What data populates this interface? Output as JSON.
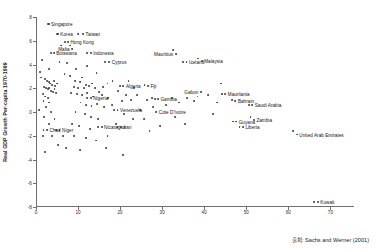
{
  "chart_data": {
    "type": "scatter",
    "title": "",
    "xlabel": "",
    "ylabel": "Real GDP Growth Per-capita 1970-1999",
    "xlim": [
      0,
      75.6
    ],
    "ylim": [
      -8,
      8
    ],
    "xticks": [
      0,
      10,
      20,
      30,
      40,
      50,
      60,
      70
    ],
    "xtick_labels": [
      "0",
      "10",
      "20",
      "30",
      "40",
      "50",
      "60",
      "70"
    ],
    "yticks": [
      8,
      6,
      4,
      2,
      0,
      -2,
      -4,
      -6,
      -8
    ],
    "ytick_labels": [
      "8",
      "6",
      "4",
      "2",
      "0",
      "-2",
      "-4",
      "-6",
      "-8"
    ],
    "grid": false,
    "legend": null,
    "marker_color": "#3a3a3a",
    "axis_color": "#6f6f6f",
    "labeled_points": [
      {
        "name": "Singapore",
        "x": 3.0,
        "y": 7.4,
        "side": "right"
      },
      {
        "name": "Korea",
        "x": 5.2,
        "y": 6.6,
        "side": "right"
      },
      {
        "name": "Taiwan",
        "x": 11.2,
        "y": 6.6,
        "side": "right"
      },
      {
        "name": "Hong Kong",
        "x": 7.6,
        "y": 5.9,
        "side": "right"
      },
      {
        "name": "Malta",
        "x": 8.6,
        "y": 5.3,
        "side": "left"
      },
      {
        "name": "Botswana",
        "x": 4.2,
        "y": 5.0,
        "side": "right"
      },
      {
        "name": "Indonesia",
        "x": 13.0,
        "y": 5.0,
        "side": "right"
      },
      {
        "name": "Mauritius",
        "x": 33.2,
        "y": 4.9,
        "side": "left"
      },
      {
        "name": "Cyprus",
        "x": 17.4,
        "y": 4.2,
        "side": "right"
      },
      {
        "name": "Iceland",
        "x": 35.8,
        "y": 4.2,
        "side": "right"
      },
      {
        "name": "Malaysia",
        "x": 39.4,
        "y": 4.3,
        "side": "right"
      },
      {
        "name": "Algeria",
        "x": 20.8,
        "y": 2.2,
        "side": "right"
      },
      {
        "name": "Fiji",
        "x": 26.6,
        "y": 2.2,
        "side": "right"
      },
      {
        "name": "Gabon",
        "x": 39.2,
        "y": 1.7,
        "side": "left"
      },
      {
        "name": "Mauritania",
        "x": 45.0,
        "y": 1.5,
        "side": "right"
      },
      {
        "name": "Nigeria",
        "x": 13.0,
        "y": 1.2,
        "side": "right"
      },
      {
        "name": "Gambia",
        "x": 29.0,
        "y": 1.1,
        "side": "right"
      },
      {
        "name": "Bahrain",
        "x": 47.4,
        "y": 0.9,
        "side": "right"
      },
      {
        "name": "Saudi Arabia",
        "x": 51.4,
        "y": 0.6,
        "side": "right"
      },
      {
        "name": "Venezuela",
        "x": 19.4,
        "y": 0.2,
        "side": "right"
      },
      {
        "name": "Cote D'Ivoire",
        "x": 28.6,
        "y": 0.0,
        "side": "right"
      },
      {
        "name": "Guyana",
        "x": 47.6,
        "y": -0.8,
        "side": "right"
      },
      {
        "name": "Zambia",
        "x": 51.8,
        "y": -0.7,
        "side": "right"
      },
      {
        "name": "Liberia",
        "x": 49.2,
        "y": -1.3,
        "side": "right"
      },
      {
        "name": "Nicaragua",
        "x": 15.6,
        "y": -1.3,
        "side": "right"
      },
      {
        "name": "Iran",
        "x": 20.2,
        "y": -1.3,
        "side": "right"
      },
      {
        "name": "Chad",
        "x": 2.6,
        "y": -1.5,
        "side": "right"
      },
      {
        "name": "Niger",
        "x": 5.6,
        "y": -1.5,
        "side": "right"
      },
      {
        "name": "United Arab Emirates",
        "x": 62.0,
        "y": -1.9,
        "side": "right"
      },
      {
        "name": "Kuwait",
        "x": 67.0,
        "y": -7.6,
        "side": "right"
      }
    ],
    "unlabeled_points": [
      {
        "x": 1.4,
        "y": 4.4
      },
      {
        "x": 1.0,
        "y": 3.4
      },
      {
        "x": 5.6,
        "y": 4.2
      },
      {
        "x": 7.4,
        "y": 4.1
      },
      {
        "x": 3.2,
        "y": 3.6
      },
      {
        "x": 9.6,
        "y": 3.6
      },
      {
        "x": 12.2,
        "y": 3.9
      },
      {
        "x": 14.4,
        "y": 3.3
      },
      {
        "x": 1.2,
        "y": 2.9
      },
      {
        "x": 2.2,
        "y": 2.8
      },
      {
        "x": 2.6,
        "y": 2.6
      },
      {
        "x": 3.0,
        "y": 2.5
      },
      {
        "x": 3.4,
        "y": 2.4
      },
      {
        "x": 3.8,
        "y": 2.3
      },
      {
        "x": 4.2,
        "y": 2.6
      },
      {
        "x": 4.6,
        "y": 2.2
      },
      {
        "x": 5.0,
        "y": 2.4
      },
      {
        "x": 2.0,
        "y": 2.1
      },
      {
        "x": 2.4,
        "y": 2.0
      },
      {
        "x": 2.8,
        "y": 1.9
      },
      {
        "x": 3.2,
        "y": 2.0
      },
      {
        "x": 3.6,
        "y": 1.8
      },
      {
        "x": 4.0,
        "y": 1.7
      },
      {
        "x": 4.4,
        "y": 1.9
      },
      {
        "x": 4.8,
        "y": 1.6
      },
      {
        "x": 1.6,
        "y": 1.5
      },
      {
        "x": 2.2,
        "y": 1.3
      },
      {
        "x": 2.8,
        "y": 1.2
      },
      {
        "x": 1.8,
        "y": 0.9
      },
      {
        "x": 3.0,
        "y": 0.8
      },
      {
        "x": 0.8,
        "y": 0.2
      },
      {
        "x": 2.4,
        "y": 0.4
      },
      {
        "x": 3.6,
        "y": 0.0
      },
      {
        "x": 2.0,
        "y": -0.4
      },
      {
        "x": 4.4,
        "y": -0.6
      },
      {
        "x": 3.2,
        "y": -1.0
      },
      {
        "x": 1.6,
        "y": -2.0
      },
      {
        "x": 3.8,
        "y": -2.0
      },
      {
        "x": 6.4,
        "y": -2.0
      },
      {
        "x": 6.8,
        "y": 3.2
      },
      {
        "x": 8.2,
        "y": 3.0
      },
      {
        "x": 9.2,
        "y": 2.6
      },
      {
        "x": 10.4,
        "y": 2.5
      },
      {
        "x": 11.0,
        "y": 2.9
      },
      {
        "x": 12.0,
        "y": 2.3
      },
      {
        "x": 9.0,
        "y": 2.1
      },
      {
        "x": 10.0,
        "y": 2.0
      },
      {
        "x": 11.4,
        "y": 2.0
      },
      {
        "x": 12.6,
        "y": 2.2
      },
      {
        "x": 13.4,
        "y": 2.4
      },
      {
        "x": 14.0,
        "y": 2.0
      },
      {
        "x": 8.4,
        "y": 1.6
      },
      {
        "x": 9.8,
        "y": 1.5
      },
      {
        "x": 11.0,
        "y": 1.4
      },
      {
        "x": 12.2,
        "y": 1.6
      },
      {
        "x": 13.6,
        "y": 1.3
      },
      {
        "x": 15.0,
        "y": 1.7
      },
      {
        "x": 16.0,
        "y": 2.1
      },
      {
        "x": 17.0,
        "y": 2.4
      },
      {
        "x": 18.2,
        "y": 2.6
      },
      {
        "x": 15.8,
        "y": 1.4
      },
      {
        "x": 17.2,
        "y": 1.2
      },
      {
        "x": 10.6,
        "y": 0.8
      },
      {
        "x": 12.0,
        "y": 0.6
      },
      {
        "x": 13.2,
        "y": 0.5
      },
      {
        "x": 14.6,
        "y": 0.7
      },
      {
        "x": 16.2,
        "y": 0.4
      },
      {
        "x": 18.0,
        "y": 0.6
      },
      {
        "x": 9.4,
        "y": 0.0
      },
      {
        "x": 11.6,
        "y": -0.2
      },
      {
        "x": 13.0,
        "y": -0.4
      },
      {
        "x": 14.8,
        "y": -0.6
      },
      {
        "x": 8.6,
        "y": -1.0
      },
      {
        "x": 10.2,
        "y": -1.2
      },
      {
        "x": 12.8,
        "y": -1.4
      },
      {
        "x": 9.0,
        "y": -2.0
      },
      {
        "x": 11.8,
        "y": -2.2
      },
      {
        "x": 14.2,
        "y": -2.4
      },
      {
        "x": 17.0,
        "y": -2.0
      },
      {
        "x": 19.6,
        "y": 1.8
      },
      {
        "x": 21.4,
        "y": 1.4
      },
      {
        "x": 20.4,
        "y": 0.9
      },
      {
        "x": 22.0,
        "y": 2.6
      },
      {
        "x": 23.4,
        "y": 2.0
      },
      {
        "x": 22.6,
        "y": 1.0
      },
      {
        "x": 24.0,
        "y": 1.4
      },
      {
        "x": 21.0,
        "y": -0.2
      },
      {
        "x": 23.0,
        "y": -0.6
      },
      {
        "x": 19.0,
        "y": -1.0
      },
      {
        "x": 24.8,
        "y": 0.2
      },
      {
        "x": 26.4,
        "y": 1.0
      },
      {
        "x": 27.6,
        "y": 1.2
      },
      {
        "x": 25.6,
        "y": -0.6
      },
      {
        "x": 27.0,
        "y": -1.6
      },
      {
        "x": 29.4,
        "y": -1.2
      },
      {
        "x": 31.0,
        "y": 0.6
      },
      {
        "x": 32.4,
        "y": 1.2
      },
      {
        "x": 34.0,
        "y": 0.8
      },
      {
        "x": 36.0,
        "y": 1.2
      },
      {
        "x": 33.0,
        "y": -0.4
      },
      {
        "x": 35.4,
        "y": -1.0
      },
      {
        "x": 37.6,
        "y": 0.9
      },
      {
        "x": 41.0,
        "y": 1.4
      },
      {
        "x": 43.0,
        "y": 0.8
      },
      {
        "x": 44.0,
        "y": 2.4
      },
      {
        "x": 42.0,
        "y": -0.2
      },
      {
        "x": 6.0,
        "y": 5.6
      },
      {
        "x": 5.0,
        "y": 6.6
      },
      {
        "x": 10.0,
        "y": 6.6
      },
      {
        "x": 7.0,
        "y": 5.9
      },
      {
        "x": 8.2,
        "y": 5.6
      },
      {
        "x": 2.8,
        "y": 7.4
      },
      {
        "x": 3.6,
        "y": 5.0
      },
      {
        "x": 12.2,
        "y": 5.0
      },
      {
        "x": 16.4,
        "y": 4.2
      },
      {
        "x": 32.6,
        "y": 5.2
      },
      {
        "x": 35.0,
        "y": 4.2
      },
      {
        "x": 38.6,
        "y": 4.5
      },
      {
        "x": 20.0,
        "y": 2.2
      },
      {
        "x": 25.8,
        "y": 2.3
      },
      {
        "x": 38.4,
        "y": 1.3
      },
      {
        "x": 44.2,
        "y": 1.5
      },
      {
        "x": 12.2,
        "y": 1.2
      },
      {
        "x": 28.2,
        "y": 1.1
      },
      {
        "x": 46.6,
        "y": 1.0
      },
      {
        "x": 50.6,
        "y": 0.6
      },
      {
        "x": 18.6,
        "y": 0.2
      },
      {
        "x": 27.8,
        "y": 0.4
      },
      {
        "x": 46.8,
        "y": -0.8
      },
      {
        "x": 51.0,
        "y": -0.4
      },
      {
        "x": 48.4,
        "y": -1.3
      },
      {
        "x": 14.8,
        "y": -1.3
      },
      {
        "x": 19.4,
        "y": -1.3
      },
      {
        "x": 1.8,
        "y": -1.5
      },
      {
        "x": 4.8,
        "y": -1.5
      },
      {
        "x": 61.2,
        "y": -1.6
      },
      {
        "x": 66.2,
        "y": -7.6
      },
      {
        "x": 7.2,
        "y": -3.0
      },
      {
        "x": 10.4,
        "y": -3.2
      },
      {
        "x": 5.2,
        "y": -2.8
      },
      {
        "x": 16.6,
        "y": -3.0
      },
      {
        "x": 20.6,
        "y": -3.6
      },
      {
        "x": 2.2,
        "y": -3.4
      }
    ]
  },
  "source_note": "출처: Sachs and Werner (2001)"
}
